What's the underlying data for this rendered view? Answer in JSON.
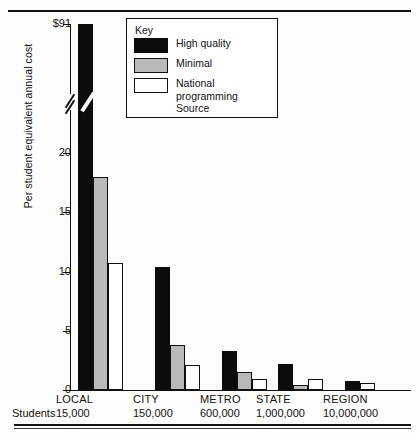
{
  "chart_data": {
    "type": "bar",
    "title": "",
    "xlabel": "Students",
    "ylabel": "Per student equivalent annual cost",
    "ylim": [
      0,
      91
    ],
    "grid": false,
    "axis_break": true,
    "axis_break_note": "y-axis broken between 20 and $91",
    "ytick_labels": [
      "0",
      "5",
      "10",
      "15",
      "20",
      "$91"
    ],
    "ytick_values": [
      0,
      5,
      10,
      15,
      20,
      91
    ],
    "categories": [
      "LOCAL",
      "CITY",
      "METRO",
      "STATE",
      "REGION"
    ],
    "category_sublabels": [
      "15,000",
      "150,000",
      "600,000",
      "1,000,000",
      "10,000,000"
    ],
    "legend_title": "Key",
    "legend_position": "top-center",
    "series": [
      {
        "name": "High quality",
        "color": "#0c0c0c",
        "values": [
          91,
          10.4,
          3.3,
          2.2,
          0.8
        ]
      },
      {
        "name": "Minimal",
        "color": "#b9b9b9",
        "values": [
          18,
          3.8,
          1.5,
          0.4,
          0
        ]
      },
      {
        "name": "National programming Source",
        "color": "#ffffff",
        "values": [
          10.7,
          2.1,
          0.9,
          0.9,
          0.6
        ]
      }
    ]
  },
  "axis": {
    "y_title": "Per student equivalent annual cost",
    "ticks": [
      {
        "label": "$91",
        "top": 24
      },
      {
        "label": "20",
        "top": 153
      },
      {
        "label": "15",
        "top": 212
      },
      {
        "label": "10",
        "top": 272
      },
      {
        "label": "5",
        "top": 331
      },
      {
        "label": "0",
        "top": 390
      }
    ],
    "students_label": "Students"
  },
  "legend": {
    "title": "Key",
    "items": [
      {
        "label": "High quality",
        "swatch": "hq"
      },
      {
        "label": "Minimal",
        "swatch": "min"
      },
      {
        "label": "National programming Source",
        "swatch": "nat"
      }
    ]
  },
  "categories": [
    {
      "name": "LOCAL",
      "students": "15,000",
      "left": 78,
      "hq": 91,
      "min": 18,
      "nat": 10.7
    },
    {
      "name": "CITY",
      "students": "150,000",
      "left": 155,
      "hq": 10.4,
      "min": 3.8,
      "nat": 2.1
    },
    {
      "name": "METRO",
      "students": "600,000",
      "left": 222,
      "hq": 3.3,
      "min": 1.5,
      "nat": 0.9
    },
    {
      "name": "STATE",
      "students": "1,000,000",
      "left": 278,
      "hq": 2.2,
      "min": 0.4,
      "nat": 0.9
    },
    {
      "name": "REGION",
      "students": "10,000,000",
      "left": 345,
      "hq": 0.8,
      "min": 0,
      "nat": 0.6
    }
  ]
}
